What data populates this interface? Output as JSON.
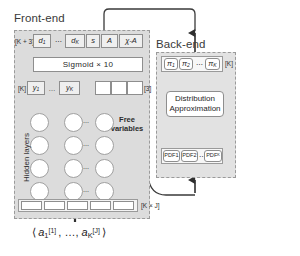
{
  "figure": {
    "type": "neural-network-architecture-diagram",
    "background": "#ffffff",
    "panel_fill": "#dcdcdc",
    "cell_border": "#8e8e8e",
    "shaded_cell_fill": "#efefef"
  },
  "frontend": {
    "title": "Front-end",
    "output_row": {
      "size_tag": "[K + 3]",
      "cells": [
        "d₁",
        "⋯",
        "d",
        "s",
        "A",
        "χ-A"
      ],
      "cell_labels": {
        "d1": "d₁",
        "ellipsis": "⋯",
        "dK": "d_K",
        "s": "s",
        "A": "A",
        "chiA": "χ-A"
      }
    },
    "activation_row": {
      "label": "Sigmoid  ×  10"
    },
    "latent_row": {
      "size_tag_left": "[K]",
      "size_tag_right": "[3]",
      "cells": [
        "y₁",
        "⋯",
        "y_K"
      ],
      "free_cells": [
        "",
        "",
        ""
      ]
    },
    "free_variables_label": "Free\nvariables",
    "hidden_layers_label": "Hidden layers",
    "input_row": {
      "size_tag": "[K × J]",
      "cells": [
        "",
        "",
        "",
        "",
        ""
      ]
    },
    "input_expression": "⟨ a₁^[1] , …, a_K^[J] ⟩"
  },
  "backend": {
    "title": "Back-end",
    "pi_row": {
      "size_tag": "[K]",
      "cells": [
        "π₁",
        "π₂",
        "⋯",
        "π_K"
      ]
    },
    "distribution_box": {
      "line1": "Distribution",
      "line2": "Approximation"
    },
    "pdf_row": {
      "cells": [
        "PDF1",
        "PDF2",
        "⋯",
        "PDF_K"
      ]
    }
  }
}
